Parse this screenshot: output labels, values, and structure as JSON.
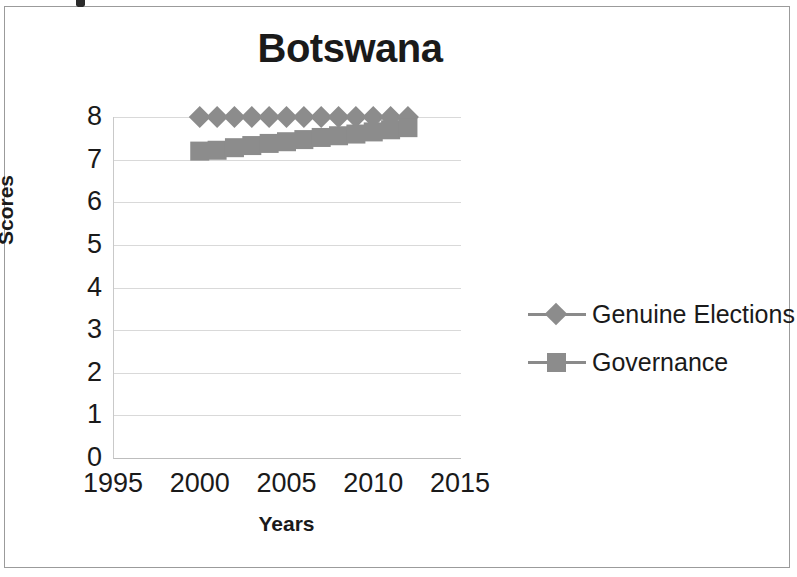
{
  "chart_data": {
    "type": "line",
    "title": "Botswana",
    "xlabel": "Years",
    "ylabel": "Scores",
    "xlim": [
      1995,
      2015
    ],
    "ylim": [
      0,
      8
    ],
    "xticks": [
      1995,
      2000,
      2005,
      2010,
      2015
    ],
    "yticks": [
      0,
      1,
      2,
      3,
      4,
      5,
      6,
      7,
      8
    ],
    "grid": true,
    "legend_position": "right",
    "x": [
      2000,
      2001,
      2002,
      2003,
      2004,
      2005,
      2006,
      2007,
      2008,
      2009,
      2010,
      2011,
      2012
    ],
    "series": [
      {
        "name": "Genuine Elections",
        "marker": "diamond",
        "color": "#8c8c8c",
        "values": [
          8.0,
          8.0,
          8.0,
          8.0,
          8.0,
          8.0,
          8.0,
          8.0,
          8.0,
          8.0,
          8.0,
          8.0,
          8.0
        ]
      },
      {
        "name": "Governance",
        "marker": "square",
        "color": "#8c8c8c",
        "values": [
          7.2,
          7.22,
          7.28,
          7.33,
          7.38,
          7.42,
          7.47,
          7.52,
          7.56,
          7.6,
          7.65,
          7.7,
          7.75
        ]
      }
    ]
  },
  "legend": {
    "items": [
      {
        "label": "Genuine Elections",
        "marker": "diamond"
      },
      {
        "label": "Governance",
        "marker": "square"
      }
    ]
  },
  "colors": {
    "series": "#8c8c8c",
    "gridline": "#d9d9d9",
    "axis": "#bdbdbd",
    "text": "#1a1a1a"
  }
}
